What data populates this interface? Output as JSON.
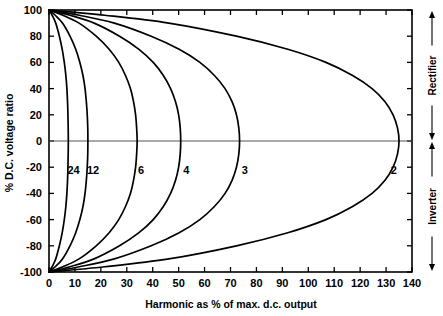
{
  "chart_data": {
    "type": "line",
    "title": "",
    "xlabel": "Harmonic as % of max. d.c. output",
    "ylabel": "% D.C. voltage ratio",
    "xlim": [
      0,
      140
    ],
    "ylim": [
      -100,
      100
    ],
    "xticks": [
      0,
      10,
      20,
      30,
      40,
      50,
      60,
      70,
      80,
      90,
      100,
      110,
      120,
      130,
      140
    ],
    "yticks": [
      100,
      80,
      60,
      40,
      20,
      0,
      -20,
      -40,
      -60,
      -80,
      -100
    ],
    "xtick_labels": [
      "0",
      "10",
      "20",
      "30",
      "40",
      "50",
      "60",
      "70",
      "80",
      "90",
      "100",
      "110",
      "120",
      "130",
      "140"
    ],
    "ytick_labels": [
      "100",
      "80",
      "60",
      "40",
      "20",
      "0",
      "-20",
      "-40",
      "-60",
      "-80",
      "-100"
    ],
    "grid": false,
    "legend_position": "inline-curve-labels",
    "annotations": [
      {
        "text": "Rectifier",
        "region": "right-axis-upper",
        "arrow": "double-vertical",
        "range": [
          0,
          100
        ]
      },
      {
        "text": "Inverter",
        "region": "right-axis-lower",
        "arrow": "double-vertical",
        "range": [
          -100,
          0
        ]
      }
    ],
    "series": [
      {
        "name": "24",
        "label": "24",
        "label_x": 9.5,
        "label_y": -22,
        "points": [
          [
            0,
            100
          ],
          [
            1.2,
            96
          ],
          [
            2.6,
            90
          ],
          [
            4.0,
            80
          ],
          [
            5.1,
            70
          ],
          [
            5.9,
            60
          ],
          [
            6.5,
            50
          ],
          [
            6.9,
            40
          ],
          [
            7.15,
            30
          ],
          [
            7.3,
            20
          ],
          [
            7.4,
            10
          ],
          [
            7.45,
            0
          ],
          [
            7.4,
            -10
          ],
          [
            7.3,
            -20
          ],
          [
            7.15,
            -30
          ],
          [
            6.9,
            -40
          ],
          [
            6.5,
            -50
          ],
          [
            5.9,
            -60
          ],
          [
            5.1,
            -70
          ],
          [
            4.0,
            -80
          ],
          [
            2.6,
            -90
          ],
          [
            1.2,
            -96
          ],
          [
            0,
            -100
          ]
        ]
      },
      {
        "name": "12",
        "label": "12",
        "label_x": 17.0,
        "label_y": -22,
        "points": [
          [
            0,
            100
          ],
          [
            2.4,
            96
          ],
          [
            5.2,
            90
          ],
          [
            8.1,
            80
          ],
          [
            10.3,
            70
          ],
          [
            11.9,
            60
          ],
          [
            13.1,
            50
          ],
          [
            13.9,
            40
          ],
          [
            14.4,
            30
          ],
          [
            14.75,
            20
          ],
          [
            14.95,
            10
          ],
          [
            15.0,
            0
          ],
          [
            14.95,
            -10
          ],
          [
            14.75,
            -20
          ],
          [
            14.4,
            -30
          ],
          [
            13.9,
            -40
          ],
          [
            13.1,
            -50
          ],
          [
            11.9,
            -60
          ],
          [
            10.3,
            -70
          ],
          [
            8.1,
            -80
          ],
          [
            5.2,
            -90
          ],
          [
            2.4,
            -96
          ],
          [
            0,
            -100
          ]
        ]
      },
      {
        "name": "6",
        "label": "6",
        "label_x": 35.5,
        "label_y": -22,
        "points": [
          [
            0,
            100
          ],
          [
            5.4,
            96
          ],
          [
            11.6,
            90
          ],
          [
            18.2,
            80
          ],
          [
            23.2,
            70
          ],
          [
            26.9,
            60
          ],
          [
            29.5,
            50
          ],
          [
            31.4,
            40
          ],
          [
            32.6,
            30
          ],
          [
            33.4,
            20
          ],
          [
            33.8,
            10
          ],
          [
            34.0,
            0
          ],
          [
            33.8,
            -10
          ],
          [
            33.4,
            -20
          ],
          [
            32.6,
            -30
          ],
          [
            31.4,
            -40
          ],
          [
            29.5,
            -50
          ],
          [
            26.9,
            -60
          ],
          [
            23.2,
            -70
          ],
          [
            18.2,
            -80
          ],
          [
            11.6,
            -90
          ],
          [
            5.4,
            -96
          ],
          [
            0,
            -100
          ]
        ]
      },
      {
        "name": "4",
        "label": "4",
        "label_x": 53.0,
        "label_y": -22,
        "points": [
          [
            0,
            100
          ],
          [
            8.1,
            96
          ],
          [
            17.4,
            90
          ],
          [
            27.2,
            80
          ],
          [
            34.7,
            70
          ],
          [
            40.2,
            60
          ],
          [
            44.1,
            50
          ],
          [
            46.9,
            40
          ],
          [
            48.8,
            30
          ],
          [
            50.0,
            20
          ],
          [
            50.6,
            10
          ],
          [
            50.8,
            0
          ],
          [
            50.6,
            -10
          ],
          [
            50.0,
            -20
          ],
          [
            48.8,
            -30
          ],
          [
            46.9,
            -40
          ],
          [
            44.1,
            -50
          ],
          [
            40.2,
            -60
          ],
          [
            34.7,
            -70
          ],
          [
            27.2,
            -80
          ],
          [
            17.4,
            -90
          ],
          [
            8.1,
            -96
          ],
          [
            0,
            -100
          ]
        ]
      },
      {
        "name": "3",
        "label": "3",
        "label_x": 75.5,
        "label_y": -22,
        "points": [
          [
            0,
            100
          ],
          [
            11.7,
            96
          ],
          [
            25.2,
            90
          ],
          [
            39.4,
            80
          ],
          [
            50.2,
            70
          ],
          [
            58.2,
            60
          ],
          [
            63.8,
            50
          ],
          [
            67.9,
            40
          ],
          [
            70.6,
            30
          ],
          [
            72.3,
            20
          ],
          [
            73.2,
            10
          ],
          [
            73.5,
            0
          ],
          [
            73.2,
            -10
          ],
          [
            72.3,
            -20
          ],
          [
            70.6,
            -30
          ],
          [
            67.9,
            -40
          ],
          [
            63.8,
            -50
          ],
          [
            58.2,
            -60
          ],
          [
            50.2,
            -70
          ],
          [
            39.4,
            -80
          ],
          [
            25.2,
            -90
          ],
          [
            11.7,
            -96
          ],
          [
            0,
            -100
          ]
        ]
      },
      {
        "name": "2",
        "label": "2",
        "label_x": 133.0,
        "label_y": -22,
        "points": [
          [
            0,
            100
          ],
          [
            21.5,
            96
          ],
          [
            46.2,
            90
          ],
          [
            72.3,
            80
          ],
          [
            92.1,
            70
          ],
          [
            106.8,
            60
          ],
          [
            117.1,
            50
          ],
          [
            124.6,
            40
          ],
          [
            129.6,
            30
          ],
          [
            132.7,
            20
          ],
          [
            134.4,
            10
          ],
          [
            135.0,
            0
          ],
          [
            134.4,
            -10
          ],
          [
            132.7,
            -20
          ],
          [
            129.6,
            -30
          ],
          [
            124.6,
            -40
          ],
          [
            117.1,
            -50
          ],
          [
            106.8,
            -60
          ],
          [
            92.1,
            -70
          ],
          [
            72.3,
            -80
          ],
          [
            46.2,
            -90
          ],
          [
            21.5,
            -96
          ],
          [
            0,
            -100
          ]
        ]
      }
    ]
  }
}
